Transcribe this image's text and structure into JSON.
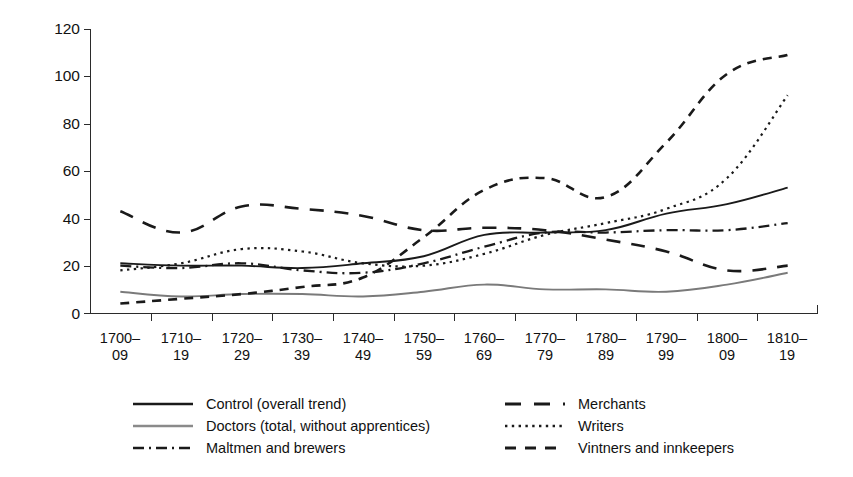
{
  "chart_data": {
    "type": "line",
    "title": "",
    "subtitle": "",
    "xlabel": "",
    "ylabel": "",
    "ylim": [
      0,
      120
    ],
    "yticks": [
      0,
      20,
      40,
      60,
      80,
      100,
      120
    ],
    "grid": false,
    "legend_position": "bottom",
    "categories": [
      "1700–\n09",
      "1710–\n19",
      "1720–\n29",
      "1730–\n39",
      "1740–\n49",
      "1750–\n59",
      "1760–\n69",
      "1770–\n79",
      "1780–\n89",
      "1790–\n99",
      "1800–\n09",
      "1810–\n19"
    ],
    "category_labels": [
      {
        "top": "1700–",
        "bottom": "09"
      },
      {
        "top": "1710–",
        "bottom": "19"
      },
      {
        "top": "1720–",
        "bottom": "29"
      },
      {
        "top": "1730–",
        "bottom": "39"
      },
      {
        "top": "1740–",
        "bottom": "49"
      },
      {
        "top": "1750–",
        "bottom": "59"
      },
      {
        "top": "1760–",
        "bottom": "69"
      },
      {
        "top": "1770–",
        "bottom": "79"
      },
      {
        "top": "1780–",
        "bottom": "89"
      },
      {
        "top": "1790–",
        "bottom": "99"
      },
      {
        "top": "1800–",
        "bottom": "09"
      },
      {
        "top": "1810–",
        "bottom": "19"
      }
    ],
    "series": [
      {
        "name": "Control (overall trend)",
        "style": "solid",
        "color": "#1a1a1a",
        "width": 1.9,
        "values": [
          21,
          20,
          20,
          19,
          21,
          24,
          33,
          34,
          35,
          42,
          46,
          53
        ]
      },
      {
        "name": "Doctors (total, without apprentices)",
        "style": "solid",
        "color": "#7a7a7a",
        "width": 1.9,
        "values": [
          9,
          7,
          8,
          8,
          7,
          9,
          12,
          10,
          10,
          9,
          12,
          17
        ]
      },
      {
        "name": "Maltmen and brewers",
        "style": "dashdot",
        "color": "#1a1a1a",
        "width": 2.3,
        "values": [
          20,
          19,
          21,
          18,
          17,
          21,
          28,
          34,
          34,
          35,
          35,
          38
        ]
      },
      {
        "name": "Merchants",
        "style": "longdash",
        "color": "#1a1a1a",
        "width": 2.6,
        "values": [
          43,
          34,
          45,
          44,
          41,
          35,
          36,
          35,
          31,
          26,
          18,
          20
        ]
      },
      {
        "name": "Writers",
        "style": "dotted",
        "color": "#1a1a1a",
        "width": 2.2,
        "values": [
          18,
          21,
          27,
          26,
          21,
          20,
          25,
          33,
          38,
          44,
          57,
          92
        ]
      },
      {
        "name": "Vintners and innkeepers",
        "style": "dashed",
        "color": "#1a1a1a",
        "width": 2.6,
        "values": [
          4,
          6,
          8,
          11,
          15,
          32,
          52,
          57,
          49,
          72,
          101,
          109
        ]
      }
    ],
    "vintners_bottom_note": "",
    "legend_entries_left": [
      "Control (overall trend)",
      "Doctors (total, without apprentices)",
      "Maltmen and brewers"
    ],
    "legend_entries_right": [
      "Merchants",
      "Writers",
      "Vintners and innkeepers"
    ]
  },
  "colors": {
    "axis": "#2b2b2b",
    "ink": "#1a1a1a",
    "gray_series": "#7a7a7a",
    "background": "#ffffff"
  }
}
